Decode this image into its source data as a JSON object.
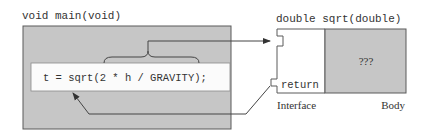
{
  "caller": {
    "signature": "void main(void)",
    "statement": "t = sqrt(2 * h / GRAVITY);"
  },
  "callee": {
    "signature": "double sqrt(double)",
    "return_label": "return",
    "body_text": "???",
    "interface_label": "Interface",
    "body_label": "Body"
  },
  "colors": {
    "box_gray": "#c6c6c6",
    "border": "#5a5a5a",
    "line": "#444444",
    "statement_bg": "#fbfbfb"
  }
}
